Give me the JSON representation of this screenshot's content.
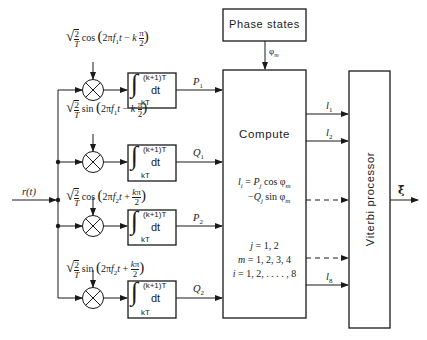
{
  "diagram": {
    "type": "block-diagram",
    "input": {
      "label": "r(t)"
    },
    "reference_signals": [
      {
        "id": "ref1",
        "text": "√(2/T) cos(2πf₁t − kπ/2)",
        "func": "cos",
        "freq": "f₁",
        "sign": "−",
        "phase": "k π/2"
      },
      {
        "id": "ref2",
        "text": "√(2/T) sin(2πf₁t − kπ/2)",
        "func": "sin",
        "freq": "f₁",
        "sign": "−",
        "phase": "k π/2"
      },
      {
        "id": "ref3",
        "text": "√(2/T) cos(2πf₂t + kπ/2)",
        "func": "cos",
        "freq": "f₂",
        "sign": "+",
        "phase": "kπ/2"
      },
      {
        "id": "ref4",
        "text": "√(2/T) sin(2πf₂t + kπ/2)",
        "func": "sin",
        "freq": "f₂",
        "sign": "+",
        "phase": "kπ/2"
      }
    ],
    "integrator": {
      "upper_limit": "(k+1)T",
      "lower_limit": "kT",
      "differential": "dt"
    },
    "integrator_outputs": [
      "P1",
      "Q1",
      "P2",
      "Q2"
    ],
    "phase_states": {
      "label": "Phase states",
      "output": "φm"
    },
    "compute": {
      "label": "Compute",
      "equation_line1": "li = Pj cos φm",
      "equation_line2": "−Qj sin φm",
      "ranges": [
        "j = 1, 2",
        "m = 1, 2, 3, 4",
        "i = 1, 2, . . . . , 8"
      ]
    },
    "compute_outputs": [
      {
        "label": "l1",
        "style": "solid"
      },
      {
        "label": "l2",
        "style": "solid"
      },
      {
        "label": "",
        "style": "dashed"
      },
      {
        "label": "",
        "style": "dashed"
      },
      {
        "label": "l8",
        "style": "solid"
      }
    ],
    "viterbi": {
      "label": "Viterbi processor",
      "output": "ξ̂"
    }
  }
}
